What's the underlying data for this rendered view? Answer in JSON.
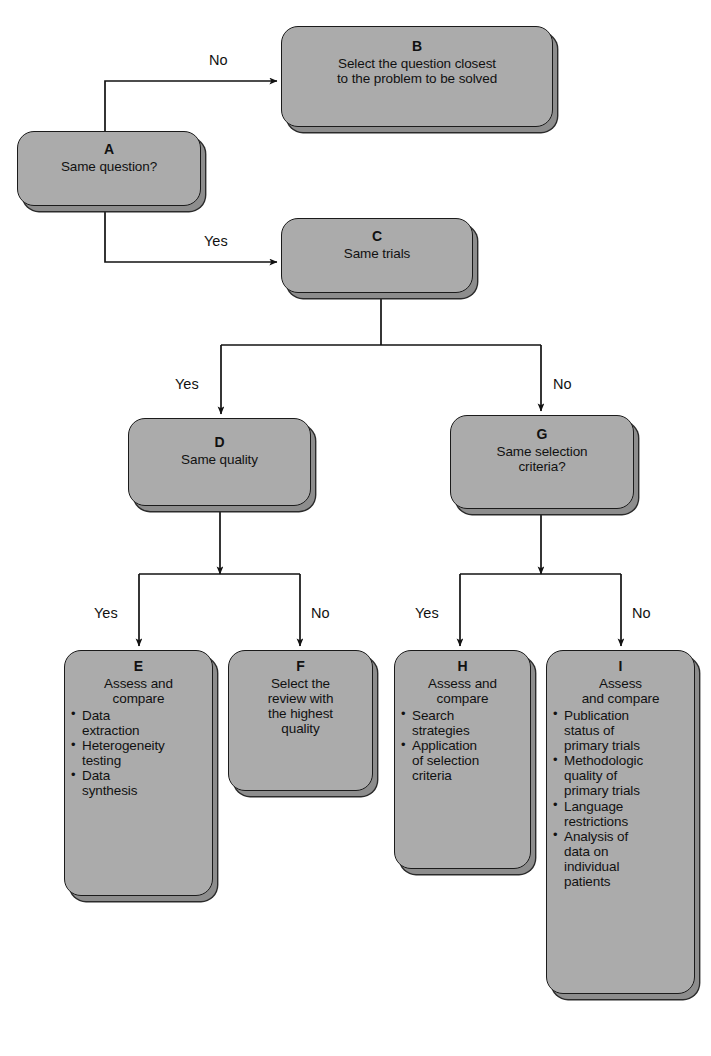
{
  "figure": {
    "type": "flowchart",
    "orientation": "top-down",
    "fill_color": "#ababab",
    "stroke_color": "#1b1b1b",
    "shadow_color": "#8d8d8d"
  },
  "nodes": {
    "A": {
      "tag": "A",
      "headline": [
        "Same question?"
      ],
      "bullets": []
    },
    "B": {
      "tag": "B",
      "headline": [
        "Select the question closest",
        "to the problem to be solved"
      ],
      "bullets": []
    },
    "C": {
      "tag": "C",
      "headline": [
        "Same trials"
      ],
      "bullets": []
    },
    "D": {
      "tag": "D",
      "headline": [
        "Same quality"
      ],
      "bullets": []
    },
    "G": {
      "tag": "G",
      "headline": [
        "Same selection",
        "criteria?"
      ],
      "bullets": []
    },
    "E": {
      "tag": "E",
      "headline": [
        "Assess and",
        "compare"
      ],
      "bullets": [
        [
          "Data",
          "extraction"
        ],
        [
          "Heterogeneity",
          "testing"
        ],
        [
          "Data",
          "synthesis"
        ]
      ]
    },
    "F": {
      "tag": "F",
      "headline": [
        "Select the",
        "review with",
        "the highest",
        "quality"
      ],
      "bullets": []
    },
    "H": {
      "tag": "H",
      "headline": [
        "Assess and",
        "compare"
      ],
      "bullets": [
        [
          "Search",
          "strategies"
        ],
        [
          "Application",
          "of selection",
          "criteria"
        ]
      ]
    },
    "I": {
      "tag": "I",
      "headline": [
        "Assess",
        "and compare"
      ],
      "bullets": [
        [
          "Publication",
          "status of",
          "primary trials"
        ],
        [
          "Methodologic",
          "quality of",
          "primary trials"
        ],
        [
          "Language",
          "restrictions"
        ],
        [
          "Analysis of",
          "data on",
          "individual",
          "patients"
        ]
      ]
    }
  },
  "edge_labels": [
    {
      "id": "a-no",
      "text": "No",
      "from": "A",
      "to": "B"
    },
    {
      "id": "a-yes",
      "text": "Yes",
      "from": "A",
      "to": "C"
    },
    {
      "id": "c-yes",
      "text": "Yes",
      "from": "C",
      "to": "D"
    },
    {
      "id": "c-no",
      "text": "No",
      "from": "C",
      "to": "G"
    },
    {
      "id": "d-yes",
      "text": "Yes",
      "from": "D",
      "to": "E"
    },
    {
      "id": "d-no",
      "text": "No",
      "from": "D",
      "to": "F"
    },
    {
      "id": "g-yes",
      "text": "Yes",
      "from": "G",
      "to": "H"
    },
    {
      "id": "g-no",
      "text": "No",
      "from": "G",
      "to": "I"
    }
  ],
  "bullet_glyph": "•"
}
